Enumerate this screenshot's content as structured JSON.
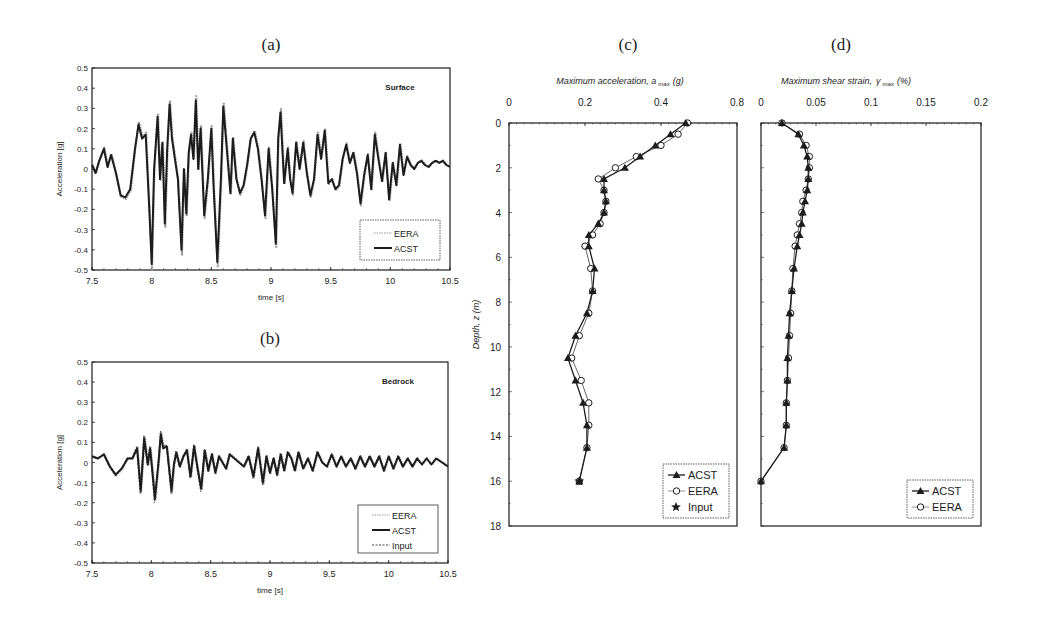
{
  "figure": {
    "panels": [
      "(a)",
      "(b)",
      "(c)",
      "(d)"
    ]
  },
  "chart_data": [
    {
      "id": "a",
      "type": "line",
      "panel_label": "(a)",
      "annotation": "Surface",
      "xlabel": "time [s]",
      "ylabel": "Acceleration [g]",
      "xlim": [
        7.5,
        10.5
      ],
      "ylim": [
        -0.5,
        0.5
      ],
      "xticks": [
        "7.5",
        "8",
        "8.5",
        "9",
        "9.5",
        "10",
        "10.5"
      ],
      "yticks": [
        "0.5",
        "0.4",
        "0.3",
        "0.2",
        "0.1",
        "0",
        "-0.1",
        "-0.2",
        "-0.3",
        "-0.4",
        "-0.5"
      ],
      "legend": [
        "EERA",
        "ACST"
      ],
      "legend_position": "lower right",
      "series": [
        {
          "name": "ACST",
          "style": "solid-thick",
          "x": [
            7.5,
            7.53,
            7.56,
            7.6,
            7.63,
            7.66,
            7.7,
            7.74,
            7.78,
            7.82,
            7.86,
            7.89,
            7.92,
            7.95,
            7.98,
            8.0,
            8.02,
            8.05,
            8.07,
            8.09,
            8.11,
            8.13,
            8.15,
            8.17,
            8.19,
            8.22,
            8.25,
            8.27,
            8.29,
            8.31,
            8.33,
            8.35,
            8.37,
            8.39,
            8.41,
            8.44,
            8.47,
            8.5,
            8.52,
            8.55,
            8.58,
            8.6,
            8.63,
            8.66,
            8.68,
            8.71,
            8.74,
            8.77,
            8.8,
            8.83,
            8.86,
            8.89,
            8.92,
            8.95,
            8.98,
            9.01,
            9.04,
            9.06,
            9.08,
            9.11,
            9.14,
            9.16,
            9.18,
            9.21,
            9.24,
            9.27,
            9.3,
            9.33,
            9.36,
            9.39,
            9.42,
            9.45,
            9.48,
            9.51,
            9.54,
            9.57,
            9.6,
            9.63,
            9.66,
            9.69,
            9.72,
            9.75,
            9.78,
            9.81,
            9.84,
            9.87,
            9.9,
            9.93,
            9.96,
            9.99,
            10.02,
            10.05,
            10.08,
            10.11,
            10.14,
            10.17,
            10.2,
            10.23,
            10.26,
            10.29,
            10.32,
            10.35,
            10.38,
            10.41,
            10.44,
            10.47,
            10.5
          ],
          "y": [
            0.02,
            -0.02,
            0.04,
            0.1,
            0.01,
            0.07,
            -0.02,
            -0.13,
            -0.14,
            -0.1,
            0.1,
            0.22,
            0.15,
            0.17,
            -0.2,
            -0.47,
            0.0,
            0.26,
            -0.05,
            0.13,
            -0.27,
            0.1,
            0.32,
            0.15,
            0.07,
            -0.05,
            -0.4,
            0.0,
            -0.22,
            0.08,
            0.17,
            0.05,
            0.34,
            0.0,
            0.2,
            -0.23,
            -0.05,
            0.2,
            -0.1,
            -0.46,
            -0.05,
            0.31,
            0.1,
            -0.12,
            0.15,
            -0.05,
            -0.12,
            -0.08,
            0.02,
            0.15,
            0.18,
            0.1,
            -0.05,
            -0.23,
            0.1,
            -0.1,
            -0.37,
            0.15,
            0.28,
            -0.07,
            0.1,
            -0.05,
            -0.12,
            0.13,
            0.0,
            0.13,
            -0.02,
            -0.13,
            -0.05,
            0.17,
            0.05,
            0.19,
            -0.07,
            -0.05,
            -0.1,
            -0.08,
            0.05,
            0.12,
            0.03,
            0.08,
            -0.02,
            -0.17,
            -0.03,
            0.07,
            -0.1,
            0.17,
            0.05,
            -0.06,
            0.08,
            -0.15,
            0.03,
            -0.08,
            0.12,
            -0.03,
            0.06,
            0.02,
            0.0,
            0.03,
            0.04,
            0.02,
            0.01,
            0.03,
            0.04,
            0.03,
            0.04,
            0.02,
            0.01
          ]
        },
        {
          "name": "EERA",
          "style": "dotted-gray",
          "note": "closely follows ACST with slightly larger peaks"
        }
      ]
    },
    {
      "id": "b",
      "type": "line",
      "panel_label": "(b)",
      "annotation": "Bedrock",
      "xlabel": "time [s]",
      "ylabel": "Acceleration [g]",
      "xlim": [
        7.5,
        10.5
      ],
      "ylim": [
        -0.5,
        0.5
      ],
      "xticks": [
        "7.5",
        "8",
        "8.5",
        "9",
        "9.5",
        "10",
        "10.5"
      ],
      "yticks": [
        "0.5",
        "0.4",
        "0.3",
        "0.2",
        "0.1",
        "0",
        "-0.1",
        "-0.2",
        "-0.3",
        "-0.4",
        "-0.5"
      ],
      "legend": [
        "EERA",
        "ACST",
        "Input"
      ],
      "legend_position": "lower right",
      "series": [
        {
          "name": "ACST",
          "style": "solid-thick",
          "x": [
            7.5,
            7.55,
            7.6,
            7.65,
            7.7,
            7.75,
            7.8,
            7.84,
            7.88,
            7.91,
            7.94,
            7.97,
            7.99,
            8.01,
            8.03,
            8.06,
            8.08,
            8.1,
            8.13,
            8.15,
            8.17,
            8.19,
            8.21,
            8.24,
            8.27,
            8.3,
            8.33,
            8.36,
            8.39,
            8.42,
            8.45,
            8.48,
            8.51,
            8.54,
            8.57,
            8.6,
            8.63,
            8.66,
            8.7,
            8.74,
            8.78,
            8.82,
            8.86,
            8.9,
            8.94,
            8.97,
            9.0,
            9.03,
            9.06,
            9.09,
            9.12,
            9.15,
            9.18,
            9.21,
            9.24,
            9.28,
            9.32,
            9.36,
            9.4,
            9.44,
            9.48,
            9.52,
            9.56,
            9.6,
            9.64,
            9.68,
            9.72,
            9.76,
            9.8,
            9.84,
            9.88,
            9.92,
            9.96,
            10.0,
            10.04,
            10.08,
            10.12,
            10.16,
            10.2,
            10.24,
            10.28,
            10.32,
            10.36,
            10.4,
            10.45,
            10.5
          ],
          "y": [
            0.03,
            0.02,
            0.04,
            -0.02,
            -0.06,
            -0.03,
            0.02,
            0.02,
            0.07,
            -0.14,
            0.12,
            -0.01,
            0.07,
            -0.05,
            -0.18,
            0.0,
            0.14,
            0.07,
            0.08,
            -0.03,
            -0.14,
            -0.01,
            0.05,
            -0.02,
            0.03,
            0.06,
            -0.07,
            0.08,
            -0.03,
            -0.13,
            0.06,
            -0.04,
            0.04,
            -0.05,
            0.03,
            0.0,
            -0.03,
            0.04,
            0.02,
            0.0,
            -0.02,
            0.03,
            -0.07,
            0.07,
            -0.1,
            0.03,
            -0.05,
            0.02,
            -0.06,
            0.04,
            -0.04,
            0.05,
            0.02,
            -0.04,
            0.05,
            -0.03,
            0.02,
            -0.04,
            0.05,
            0.0,
            -0.02,
            0.04,
            -0.02,
            0.03,
            -0.02,
            0.02,
            -0.03,
            0.03,
            -0.02,
            0.03,
            -0.02,
            0.03,
            -0.04,
            0.03,
            -0.03,
            0.03,
            -0.02,
            0.02,
            -0.02,
            0.02,
            -0.01,
            0.02,
            -0.01,
            0.02,
            0.0,
            -0.02
          ]
        },
        {
          "name": "EERA",
          "style": "dotted-gray"
        },
        {
          "name": "Input",
          "style": "dashed"
        }
      ]
    },
    {
      "id": "c",
      "type": "line",
      "panel_label": "(c)",
      "title": "Maximum acceleration, a max (g)",
      "xlabel_main": "Maximum acceleration, a",
      "xlabel_sub": "max",
      "xlabel_unit": "(g)",
      "ylabel": "Depth, z (m)",
      "xticks": [
        "0",
        "0.2",
        "0.4",
        "0.8"
      ],
      "xlim": [
        0,
        0.6
      ],
      "yticks": [
        "0",
        "2",
        "4",
        "6",
        "8",
        "10",
        "12",
        "14",
        "16",
        "18"
      ],
      "ylim": [
        0,
        18
      ],
      "y_inverted": true,
      "x_axis_position": "top",
      "legend": [
        "ACST",
        "EERA",
        "Input"
      ],
      "legend_position": "lower right",
      "series": [
        {
          "name": "ACST",
          "marker": "filled-triangle",
          "depth": [
            0,
            0.5,
            1.0,
            1.5,
            2.0,
            2.5,
            3.0,
            3.5,
            4.0,
            4.5,
            5.0,
            5.5,
            6.5,
            7.5,
            8.5,
            9.5,
            10.5,
            11.5,
            12.5,
            13.5,
            14.5,
            16.0
          ],
          "value": [
            0.465,
            0.425,
            0.385,
            0.345,
            0.305,
            0.25,
            0.25,
            0.255,
            0.25,
            0.235,
            0.21,
            0.21,
            0.225,
            0.22,
            0.205,
            0.175,
            0.155,
            0.175,
            0.195,
            0.205,
            0.205,
            0.185
          ]
        },
        {
          "name": "EERA",
          "marker": "open-circle",
          "depth": [
            0,
            0.5,
            1.0,
            1.5,
            2.0,
            2.5,
            3.0,
            3.5,
            4.0,
            4.5,
            5.0,
            5.5,
            6.5,
            7.5,
            8.5,
            9.5,
            10.5,
            11.5,
            12.5,
            13.5,
            14.5,
            16.0
          ],
          "value": [
            0.47,
            0.445,
            0.4,
            0.335,
            0.28,
            0.235,
            0.25,
            0.255,
            0.25,
            0.24,
            0.22,
            0.2,
            0.215,
            0.22,
            0.21,
            0.185,
            0.165,
            0.19,
            0.21,
            0.21,
            0.205,
            0.185
          ]
        },
        {
          "name": "Input",
          "marker": "filled-star",
          "depth": [
            16.0
          ],
          "value": [
            0.185
          ]
        }
      ]
    },
    {
      "id": "d",
      "type": "line",
      "panel_label": "(d)",
      "title": "Maximum shear strain, γ max (%)",
      "xlabel_main": "Maximum shear strain,",
      "xlabel_sym": "γ",
      "xlabel_sub": "max",
      "xlabel_unit": "(%)",
      "xticks": [
        "0",
        "0.05",
        "0.1",
        "0.15",
        "0.2"
      ],
      "xlim": [
        0,
        0.2
      ],
      "ylim": [
        0,
        18
      ],
      "y_inverted": true,
      "x_axis_position": "top",
      "legend": [
        "ACST",
        "EERA"
      ],
      "legend_position": "lower right",
      "series": [
        {
          "name": "ACST",
          "marker": "filled-triangle",
          "depth": [
            0,
            0.5,
            1.0,
            1.5,
            2.0,
            2.5,
            3.0,
            3.5,
            4.0,
            4.5,
            5.0,
            5.5,
            6.5,
            7.5,
            8.5,
            9.5,
            10.5,
            11.5,
            12.5,
            13.5,
            14.5,
            16.0
          ],
          "value": [
            0.019,
            0.034,
            0.039,
            0.042,
            0.043,
            0.043,
            0.042,
            0.04,
            0.038,
            0.037,
            0.035,
            0.033,
            0.03,
            0.028,
            0.026,
            0.025,
            0.024,
            0.024,
            0.023,
            0.023,
            0.021,
            0.0
          ]
        },
        {
          "name": "EERA",
          "marker": "open-circle",
          "depth": [
            0,
            0.5,
            1.0,
            1.5,
            2.0,
            2.5,
            3.0,
            3.5,
            4.0,
            4.5,
            5.0,
            5.5,
            6.5,
            7.5,
            8.5,
            9.5,
            10.5,
            11.5,
            12.5,
            13.5,
            14.5,
            16.0
          ],
          "value": [
            0.019,
            0.035,
            0.041,
            0.044,
            0.044,
            0.043,
            0.041,
            0.038,
            0.037,
            0.035,
            0.033,
            0.031,
            0.029,
            0.028,
            0.027,
            0.026,
            0.025,
            0.024,
            0.023,
            0.023,
            0.021,
            0.0
          ]
        }
      ]
    }
  ]
}
